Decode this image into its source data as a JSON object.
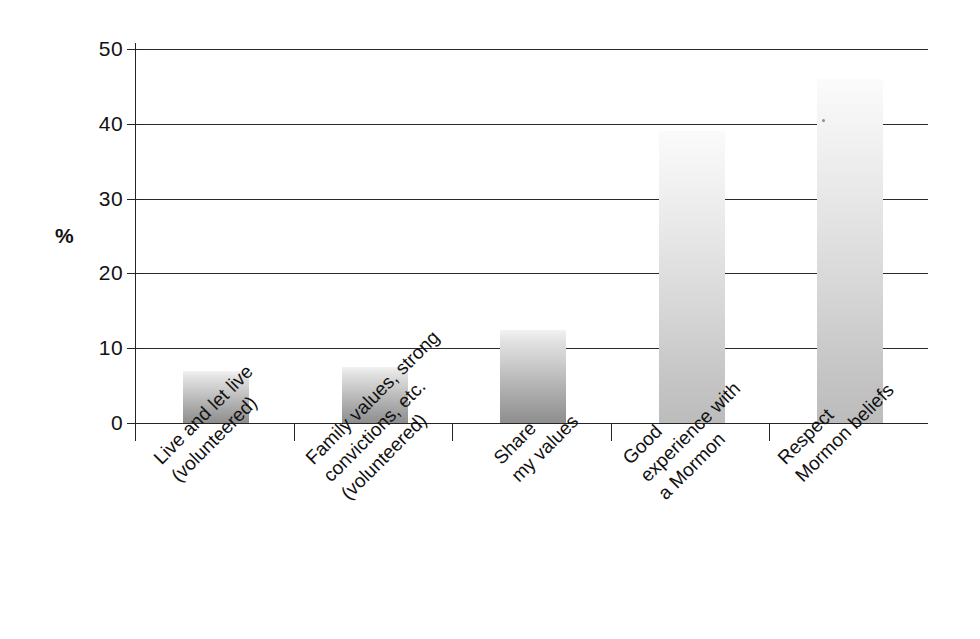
{
  "chart_data": {
    "type": "bar",
    "title": "",
    "subtitle": "",
    "xlabel": "",
    "ylabel": "%",
    "ylim": [
      0,
      50
    ],
    "grid": true,
    "legend": "none",
    "orientation": "vertical",
    "bar_fill": "grayscale-vertical-gradient",
    "categories": [
      "Live and let live (volunteered)",
      "Family values, strong convictions, etc. (volunteered)",
      "Share my values",
      "Good experience with a Mormon",
      "Respect Mormon beliefs"
    ],
    "category_lines": [
      [
        "Live and let live",
        "(volunteered)"
      ],
      [
        "Family values, strong",
        "convictions, etc.",
        "(volunteered)"
      ],
      [
        "Share",
        "my values"
      ],
      [
        "Good",
        "experience with",
        "a Mormon"
      ],
      [
        "Respect",
        "Mormon beliefs"
      ]
    ],
    "values": [
      7,
      7.5,
      12.5,
      39,
      46
    ],
    "yticks": [
      0,
      10,
      20,
      30,
      40,
      50
    ],
    "ytick_labels": [
      "0",
      "10",
      "20",
      "30",
      "40",
      "50"
    ],
    "gridlines_at": [
      10,
      20,
      30,
      40,
      50
    ],
    "axis_color": "#242424",
    "grid_color": "#2b2b2b",
    "background": "#ffffff",
    "label_rotation_deg": -45
  }
}
